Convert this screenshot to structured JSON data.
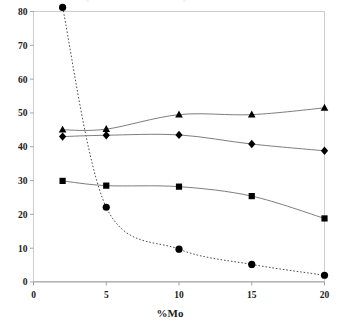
{
  "chart_data": {
    "type": "line",
    "title": "",
    "subtitle": "",
    "xlabel": "%Mo",
    "ylabel": "",
    "xlim": [
      0,
      20
    ],
    "ylim": [
      0,
      80
    ],
    "x_ticks": [
      0,
      5,
      10,
      15,
      20
    ],
    "x_tick_labels": [
      "0",
      "5",
      "10",
      "15",
      "20"
    ],
    "y_ticks": [
      0,
      10,
      20,
      30,
      40,
      50,
      60,
      70,
      80
    ],
    "y_tick_labels": [
      "0",
      "10",
      "20",
      "30",
      "40",
      "50",
      "60",
      "70",
      "80"
    ],
    "grid": false,
    "legend": "none",
    "x": [
      2,
      5,
      10,
      15,
      20
    ],
    "series": [
      {
        "name": "circle-series",
        "marker": "circle",
        "linestyle": "dashed",
        "color": "#000000",
        "values": [
          81.2,
          22.1,
          9.7,
          5.2,
          2.0
        ]
      },
      {
        "name": "triangle-series",
        "marker": "triangle",
        "linestyle": "solid",
        "color": "#000000",
        "values": [
          45.0,
          45.2,
          49.5,
          49.5,
          51.5
        ]
      },
      {
        "name": "diamond-series",
        "marker": "diamond",
        "linestyle": "solid",
        "color": "#000000",
        "values": [
          43.0,
          43.4,
          43.5,
          40.8,
          38.8
        ]
      },
      {
        "name": "square-series",
        "marker": "square",
        "linestyle": "solid",
        "color": "#000000",
        "values": [
          29.9,
          28.5,
          28.2,
          25.4,
          18.8
        ]
      }
    ]
  },
  "axis": {
    "x_title": "%Mo"
  },
  "colors": {
    "marker": "#000000",
    "solid_line": "#6e6e6e",
    "dashed_line": "#3a3a3a",
    "border": "#c8c8c8",
    "axis": "#9a9a9a",
    "text": "#1a1a1a",
    "background": "#ffffff"
  }
}
